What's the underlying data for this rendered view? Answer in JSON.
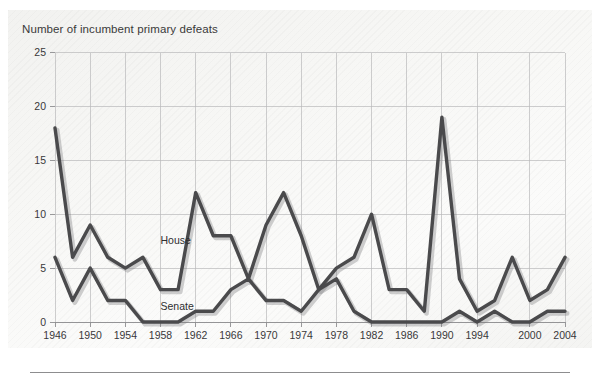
{
  "figure": {
    "title": "Number of incumbent primary defeats",
    "background_color": "#f5f5f3",
    "line_color": "#4a4a4c",
    "grid_color": "#b9b9bb"
  },
  "chart_data": {
    "type": "line",
    "title": "Number of incumbent primary defeats",
    "xlabel": "",
    "ylabel": "Number of incumbent primary defeats",
    "xlim": [
      1946,
      2004
    ],
    "ylim": [
      0,
      25
    ],
    "yticks": [
      0,
      5,
      10,
      15,
      20,
      25
    ],
    "ytick_labels": [
      "0",
      "5",
      "10",
      "15",
      "20",
      "25"
    ],
    "xticks": [
      1946,
      1950,
      1954,
      1958,
      1962,
      1966,
      1970,
      1974,
      1978,
      1982,
      1986,
      1990,
      1994,
      2000,
      2004
    ],
    "xtick_labels": [
      "1946",
      "1950",
      "1954",
      "1958",
      "1962",
      "1966",
      "1970",
      "1974",
      "1978",
      "1982",
      "1986",
      "1990",
      "1994",
      "2000",
      "2004"
    ],
    "x": [
      1946,
      1948,
      1950,
      1952,
      1954,
      1956,
      1958,
      1960,
      1962,
      1964,
      1966,
      1968,
      1970,
      1972,
      1974,
      1976,
      1978,
      1980,
      1982,
      1984,
      1986,
      1988,
      1990,
      1992,
      1994,
      1996,
      1998,
      2000,
      2002,
      2004
    ],
    "grid": true,
    "legend_position": "inline-annotation",
    "series": [
      {
        "name": "House",
        "label": "House",
        "color": "#4a4a4c",
        "annotation": {
          "text": "House",
          "x": 1958,
          "y": 7.2
        },
        "values": [
          18,
          6,
          9,
          6,
          5,
          6,
          3,
          3,
          12,
          8,
          8,
          4,
          9,
          12,
          8,
          3,
          5,
          6,
          10,
          3,
          3,
          1,
          19,
          4,
          1,
          2,
          6,
          2,
          3,
          6
        ]
      },
      {
        "name": "Senate",
        "label": "Senate",
        "color": "#4a4a4c",
        "annotation": {
          "text": "Senate",
          "x": 1958,
          "y": 1.1
        },
        "values": [
          6,
          2,
          5,
          2,
          2,
          0,
          0,
          0,
          1,
          1,
          3,
          4,
          2,
          2,
          1,
          3,
          4,
          1,
          0,
          0,
          0,
          0,
          0,
          1,
          0,
          1,
          0,
          0,
          1,
          1
        ]
      }
    ]
  }
}
